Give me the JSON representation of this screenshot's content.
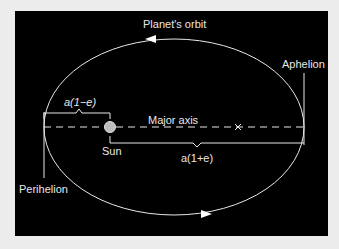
{
  "diagram": {
    "title": "Planet's orbit",
    "labels": {
      "orbit": "Planet's orbit",
      "aphelion": "Aphelion",
      "perihelion": "Perihelion",
      "major_axis": "Major axis",
      "sun": "Sun",
      "perihelion_distance": "a(1−e)",
      "aphelion_distance": "a(1+e)",
      "empty_focus_marker": "×"
    },
    "colors": {
      "background": "#000000",
      "frame": "#ececec",
      "lines": "#e8e8e8",
      "sun": "#bdbdbd"
    }
  }
}
